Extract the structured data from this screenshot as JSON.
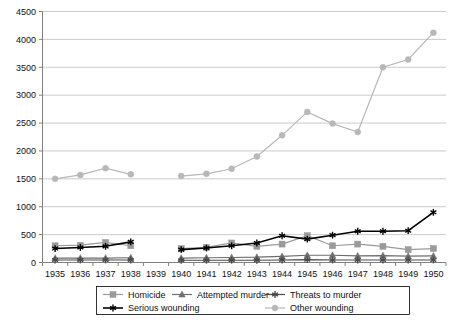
{
  "chart_data": {
    "type": "line",
    "title": "",
    "subtitle": "",
    "xlabel": "",
    "ylabel": "",
    "xlim": [
      1935,
      1950
    ],
    "ylim": [
      0,
      4500
    ],
    "ytick_step": 500,
    "grid": true,
    "legend_position": "bottom",
    "x": [
      1935,
      1936,
      1937,
      1938,
      1939,
      1940,
      1941,
      1942,
      1943,
      1944,
      1945,
      1946,
      1947,
      1948,
      1949,
      1950
    ],
    "xtick_labels": [
      "1935",
      "1936",
      "1937",
      "1938",
      "1939",
      "1940",
      "1941",
      "1942",
      "1943",
      "1944",
      "1945",
      "1946",
      "1947",
      "1948",
      "1949",
      "1950"
    ],
    "ytick_labels": [
      "0",
      "500",
      "1000",
      "1500",
      "2000",
      "2500",
      "3000",
      "3500",
      "4000",
      "4500"
    ],
    "ytick_values": [
      0,
      500,
      1000,
      1500,
      2000,
      2500,
      3000,
      3500,
      4000,
      4500
    ],
    "series": [
      {
        "name": "Homicide",
        "marker": "square",
        "color": "#9a9a9a",
        "values": [
          300,
          310,
          360,
          300,
          null,
          250,
          270,
          350,
          290,
          330,
          480,
          300,
          330,
          290,
          230,
          250
        ]
      },
      {
        "name": "Attempted murder",
        "marker": "triangle",
        "color": "#6e6e6e",
        "values": [
          80,
          80,
          80,
          85,
          null,
          80,
          85,
          90,
          95,
          110,
          130,
          130,
          120,
          125,
          115,
          120
        ]
      },
      {
        "name": "Threats to murder",
        "marker": "asterisk",
        "color": "#4a4a4a",
        "values": [
          45,
          45,
          45,
          45,
          null,
          40,
          40,
          40,
          40,
          45,
          50,
          45,
          45,
          45,
          45,
          45
        ]
      },
      {
        "name": "Serious wounding",
        "marker": "asterisk",
        "color": "#000000",
        "values": [
          250,
          270,
          290,
          370,
          null,
          230,
          260,
          300,
          350,
          480,
          420,
          490,
          560,
          560,
          570,
          900
        ]
      },
      {
        "name": "Other wounding",
        "marker": "circle",
        "color": "#b8b8b8",
        "values": [
          1500,
          1570,
          1690,
          1580,
          null,
          1550,
          1590,
          1680,
          1900,
          2280,
          2700,
          2490,
          2340,
          3500,
          3640,
          4120
        ]
      }
    ]
  },
  "legend": {
    "entries": [
      {
        "label": "Homicide"
      },
      {
        "label": "Attempted murder"
      },
      {
        "label": "Threats to murder"
      },
      {
        "label": "Serious wounding"
      },
      {
        "label": "Other wounding"
      }
    ]
  }
}
